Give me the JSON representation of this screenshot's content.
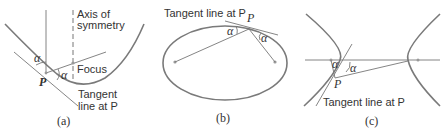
{
  "panels": [
    {
      "id": "a",
      "caption": "(a)",
      "title": "Parabola reflection property",
      "labels": {
        "axis_line1": "Axis of",
        "axis_line2": "symmetry",
        "focus": "Focus",
        "tangent_line1": "Tangent",
        "tangent_line2": "line at P",
        "point": "P",
        "angle1": "α",
        "angle2": "α"
      }
    },
    {
      "id": "b",
      "caption": "(b)",
      "title": "Ellipse reflection property",
      "labels": {
        "tangent": "Tangent line at P",
        "point": "P",
        "angle1": "α",
        "angle2": "α"
      }
    },
    {
      "id": "c",
      "caption": "(c)",
      "title": "Hyperbola reflection property",
      "labels": {
        "tangent": "Tangent line at P",
        "point": "P",
        "angle1": "α",
        "angle2": "α"
      }
    }
  ],
  "colors": {
    "curve": "#7a7a7a",
    "line": "#777777",
    "text": "#333333"
  }
}
